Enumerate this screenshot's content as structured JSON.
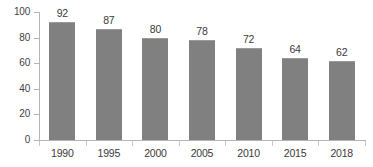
{
  "chart_data": {
    "type": "bar",
    "title": "",
    "subtitle": "",
    "xlabel": "",
    "ylabel": "",
    "categories": [
      "1990",
      "1995",
      "2000",
      "2005",
      "2010",
      "2015",
      "2018"
    ],
    "values": [
      92,
      87,
      80,
      78,
      72,
      64,
      62
    ],
    "data_labels": [
      "92",
      "87",
      "80",
      "78",
      "72",
      "64",
      "62"
    ],
    "ylim": [
      0,
      100
    ],
    "y_ticks": [
      0,
      20,
      40,
      60,
      80,
      100
    ],
    "y_tick_labels": [
      "0",
      "20",
      "40",
      "60",
      "80",
      "100"
    ],
    "grid": false,
    "legend": false,
    "legend_position": "none",
    "annotations": [],
    "colors": {
      "bar_fill": "#808080",
      "axis_line": "#b5b5b5",
      "tick_mark": "#c8c8c8",
      "label_text": "#3a3a3a",
      "background": "#ffffff"
    }
  }
}
